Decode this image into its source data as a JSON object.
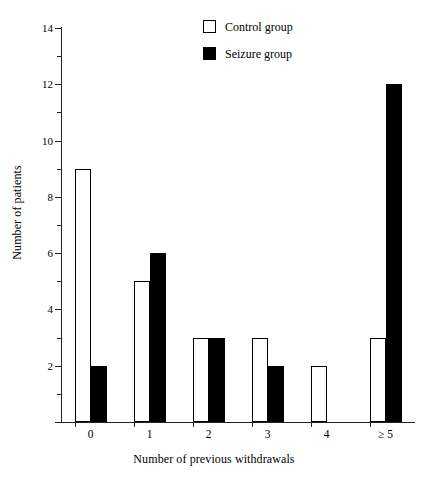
{
  "chart_data": {
    "type": "bar",
    "title": "",
    "xlabel": "Number of previous withdrawals",
    "ylabel": "Number of patients",
    "categories": [
      "0",
      "1",
      "2",
      "3",
      "4",
      "≥ 5"
    ],
    "series": [
      {
        "name": "Control group",
        "color": "#ffffff",
        "edge_color": "#000000",
        "values": [
          9,
          5,
          3,
          3,
          2,
          3
        ]
      },
      {
        "name": "Seizure group",
        "color": "#000000",
        "edge_color": "#000000",
        "values": [
          2,
          6,
          3,
          2,
          0,
          12
        ]
      }
    ],
    "ylim": [
      0,
      14
    ],
    "y_major_ticks": [
      0,
      2,
      4,
      6,
      8,
      10,
      12,
      14
    ],
    "y_major_tick_labels": [
      "",
      "2",
      "4",
      "6",
      "8",
      "10",
      "12",
      "14"
    ],
    "y_minor_ticks": [
      1,
      3,
      5,
      7,
      9,
      11,
      13
    ],
    "grid": false,
    "legend_position": "top-right",
    "legend_entries": [
      "Control group",
      "Seizure group"
    ]
  },
  "legend": {
    "control_label": "Control group",
    "seizure_label": "Seizure group"
  },
  "axes": {
    "x_title": "Number of previous withdrawals",
    "y_title": "Number of patients"
  }
}
